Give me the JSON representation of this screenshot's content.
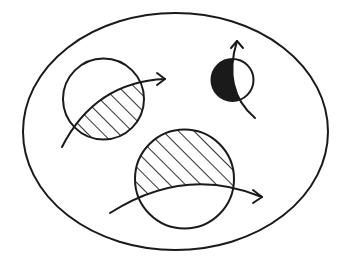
{
  "diagram": {
    "description": "Large ellipse containing three circles, each crossed by a curved arrow; circle regions partially hatched or filled",
    "colors": {
      "stroke": "#1a1a1a",
      "background": "#ffffff",
      "fill_solid": "#1a1a1a"
    },
    "outer_ellipse": {
      "cx": 175.5,
      "cy": 131.5,
      "rx": 152.5,
      "ry": 118.5
    },
    "elements": [
      {
        "id": "circle-top-left",
        "shape": "circle",
        "cx": 103.5,
        "cy": 99,
        "r": 40.5,
        "fill": "hatched",
        "fill_region": "below curve",
        "arrow": {
          "direction": "right",
          "path": "M62,147 Q95,82 165,79",
          "tip": [
            165,
            79
          ]
        }
      },
      {
        "id": "circle-small-right",
        "shape": "circle",
        "cx": 232.5,
        "cy": 80,
        "r": 21,
        "fill": "solid-black",
        "fill_region": "left of curve",
        "arrow": {
          "direction": "up",
          "path": "M255,118 Q222,90 237,41",
          "tip": [
            237,
            41
          ]
        }
      },
      {
        "id": "circle-bottom",
        "shape": "circle",
        "cx": 184.5,
        "cy": 179,
        "r": 49.5,
        "fill": "hatched",
        "fill_region": "above curve",
        "arrow": {
          "direction": "right",
          "path": "M110,213 Q185,165 262,197",
          "tip": [
            262,
            197
          ]
        }
      }
    ]
  }
}
